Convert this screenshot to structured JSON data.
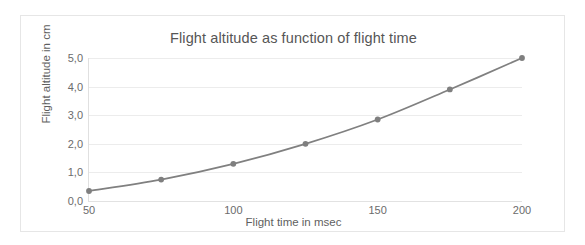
{
  "chart_data": {
    "type": "line",
    "title": "Flight altitude as function of flight time",
    "xlabel": "Flight time in msec",
    "ylabel": "Flight altitude in cm",
    "x": [
      50,
      75,
      100,
      125,
      150,
      175,
      200
    ],
    "values": [
      0.35,
      0.75,
      1.3,
      2.0,
      2.85,
      3.9,
      5.0
    ],
    "series": [
      {
        "name": "Flight altitude",
        "values": [
          0.35,
          0.75,
          1.3,
          2.0,
          2.85,
          3.9,
          5.0
        ]
      }
    ],
    "xlim": [
      50,
      200
    ],
    "ylim": [
      0.0,
      5.0
    ],
    "x_ticks": [
      50,
      100,
      150,
      200
    ],
    "x_tick_labels": [
      "50",
      "100",
      "150",
      "200"
    ],
    "y_ticks": [
      0.0,
      1.0,
      2.0,
      3.0,
      4.0,
      5.0
    ],
    "y_tick_labels": [
      "0,0",
      "1,0",
      "2,0",
      "3,0",
      "4,0",
      "5,0"
    ],
    "grid": "horizontal",
    "legend": "none",
    "marker": "circle",
    "line_color": "#808080",
    "marker_color": "#7f7f7f",
    "grid_color": "#ececec",
    "axis_color": "#e0e0e0",
    "text_color": "#6b6b6b",
    "title_color": "#565656",
    "background": "#ffffff",
    "border_color": "#e6e6e6"
  }
}
